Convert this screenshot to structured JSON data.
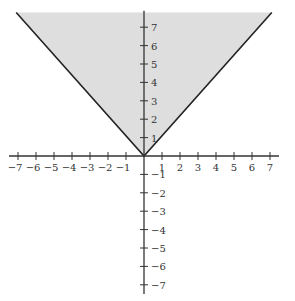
{
  "chart_data": {
    "type": "area",
    "title": "",
    "xlabel": "",
    "ylabel": "",
    "function": "y = |x|",
    "inequality": "y >= |x|",
    "xlim": [
      -7.5,
      7.5
    ],
    "ylim": [
      -7.5,
      7.9
    ],
    "grid": false,
    "legend": null,
    "x_ticks": [
      -7,
      -6,
      -5,
      -4,
      -3,
      -2,
      -1,
      1,
      2,
      3,
      4,
      5,
      6,
      7
    ],
    "y_ticks": [
      -7,
      -6,
      -5,
      -4,
      -3,
      -2,
      -1,
      1,
      2,
      3,
      4,
      5,
      6,
      7
    ],
    "x_tick_labels": [
      "−7",
      "−6",
      "−5",
      "−4",
      "−3",
      "−2",
      "−1",
      "1",
      "2",
      "3",
      "4",
      "5",
      "6",
      "7"
    ],
    "y_tick_labels": [
      "−7",
      "−6",
      "−5",
      "−4",
      "−3",
      "−2",
      "−1",
      "1",
      "2",
      "3",
      "4",
      "5",
      "6",
      "7"
    ],
    "series": [
      {
        "name": "y = |x| boundary",
        "x": [
          -7.1,
          0,
          7.1
        ],
        "y": [
          7.8,
          0,
          7.8
        ],
        "style": "solid"
      }
    ],
    "shaded_region": {
      "vertices": [
        [
          -7.1,
          7.8
        ],
        [
          0,
          0
        ],
        [
          7.1,
          7.8
        ]
      ],
      "fill": "#dedede"
    }
  },
  "colors": {
    "shade": "#dedede",
    "line": "#222222",
    "axis": "#333333",
    "label": "#333333",
    "background": "#ffffff"
  }
}
